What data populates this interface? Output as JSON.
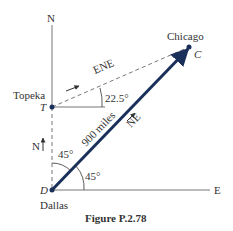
{
  "figure": {
    "caption": "Figure P.2.78",
    "cities": {
      "topeka": {
        "name": "Topeka",
        "label": "T"
      },
      "dallas": {
        "name": "Dallas",
        "label": "D"
      },
      "chicago": {
        "name": "Chicago",
        "label": "C"
      }
    },
    "axes": {
      "north": "N",
      "east": "E"
    },
    "directions": {
      "ene": "ENE",
      "ne": "NE",
      "north_small": "N"
    },
    "distance": "900 miles",
    "angles": {
      "ene_angle": "22.5°",
      "dallas_from_north": "45°",
      "dallas_from_east": "45°"
    },
    "colors": {
      "vector": "#1a2f5a",
      "line": "#555555"
    }
  }
}
